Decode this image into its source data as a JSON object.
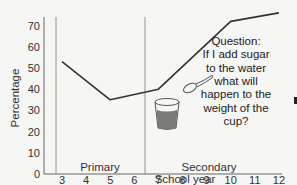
{
  "chart_data": {
    "type": "line",
    "title": "",
    "xlabel": "School year",
    "ylabel": "Percentage",
    "x": [
      3,
      5,
      7,
      10,
      12
    ],
    "values": [
      53,
      35,
      40,
      72,
      76
    ],
    "x_ticks": [
      "3",
      "4",
      "5",
      "6",
      "7",
      "8",
      "9",
      "10",
      "11",
      "12"
    ],
    "y_ticks": [
      "0",
      "10",
      "20",
      "30",
      "40",
      "50",
      "60",
      "70"
    ],
    "ylim": [
      0,
      75
    ],
    "xlim": [
      2.5,
      12
    ],
    "grid": false,
    "legend": null,
    "regions": [
      {
        "label": "Primary",
        "from": 2.5,
        "to": 6.5
      },
      {
        "label": "Secondary",
        "from": 6.5,
        "to": 12
      }
    ],
    "annotations": [
      {
        "text": "Question: If I add sugar to the water what will happen to the weight of the cup?"
      }
    ]
  },
  "axes": {
    "xlabel": "School year",
    "ylabel": "Percentage",
    "x_ticks": [
      "3",
      "4",
      "5",
      "6",
      "7",
      "8",
      "9",
      "10",
      "11",
      "12"
    ],
    "y_ticks": [
      "0",
      "10",
      "20",
      "30",
      "40",
      "50",
      "60",
      "70"
    ]
  },
  "regions": {
    "primary": "Primary",
    "secondary": "Secondary"
  },
  "question": {
    "lines": [
      "Question:",
      "If I add sugar",
      "to the water",
      "what will",
      "happen to the",
      "weight of the",
      "cup?"
    ]
  },
  "illustration": {
    "cup": "cup-with-water-icon",
    "spoon": "spoon-icon"
  },
  "colors": {
    "line": "#333333",
    "axis": "#555555",
    "divider": "#888888",
    "water": "#7a7a78"
  }
}
